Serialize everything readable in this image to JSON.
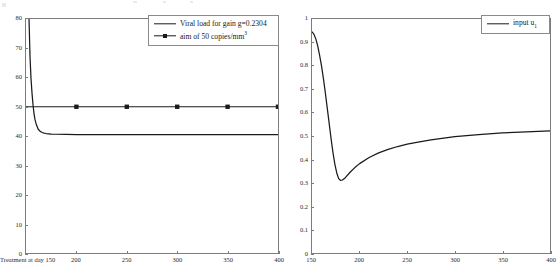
{
  "figure": {
    "background": "#ffffff",
    "line_color": "#1a1a1a",
    "axis_color": "#7c7c7c"
  },
  "chart_data": [
    {
      "type": "line",
      "panel": "left",
      "title": "",
      "xlabel": "",
      "ylabel": "",
      "xlim": [
        150,
        400
      ],
      "ylim": [
        0,
        80
      ],
      "grid": false,
      "legend_position": "top-right",
      "xticks": [
        150,
        200,
        250,
        300,
        350,
        400
      ],
      "xticklabels": [
        "Treatment at day 150",
        "200",
        "250",
        "300",
        "350",
        "400"
      ],
      "yticks": [
        0,
        10,
        20,
        30,
        40,
        50,
        60,
        70,
        80
      ],
      "yticklabels": [
        "0",
        "10",
        "20",
        "30",
        "40",
        "50",
        "60",
        "70",
        "80"
      ],
      "series": [
        {
          "name": "Viral load for gain g=0.2304",
          "marker": "none",
          "x": [
            150,
            151,
            152,
            153,
            154,
            155,
            156,
            157,
            158,
            159,
            160,
            162,
            164,
            166,
            168,
            170,
            175,
            180,
            190,
            200,
            220,
            250,
            300,
            350,
            400
          ],
          "y": [
            260,
            150,
            103,
            80,
            67,
            59.5,
            54.5,
            50.5,
            47.5,
            45.5,
            44.2,
            42.4,
            41.6,
            41.2,
            41.0,
            40.85,
            40.65,
            40.6,
            40.55,
            40.5,
            40.5,
            40.5,
            40.5,
            40.5,
            40.5
          ]
        },
        {
          "name": "aim of 50 copies/mm3",
          "marker": "filled-square",
          "x": [
            150,
            200,
            250,
            300,
            350,
            400
          ],
          "y": [
            50,
            50,
            50,
            50,
            50,
            50
          ],
          "marker_x": [
            200,
            250,
            300,
            350,
            400
          ]
        }
      ]
    },
    {
      "type": "line",
      "panel": "right",
      "title": "",
      "xlabel": "",
      "ylabel": "",
      "xlim": [
        150,
        400
      ],
      "ylim": [
        0,
        1
      ],
      "grid": false,
      "legend_position": "top-right",
      "xticks": [
        150,
        200,
        250,
        300,
        350,
        400
      ],
      "xticklabels": [
        "150",
        "200",
        "250",
        "300",
        "350",
        "400"
      ],
      "yticks": [
        0,
        0.1,
        0.2,
        0.3,
        0.4,
        0.5,
        0.6,
        0.7,
        0.8,
        0.9,
        1
      ],
      "yticklabels": [
        "0",
        "0.1",
        "0.2",
        "0.3",
        "0.4",
        "0.5",
        "0.6",
        "0.7",
        "0.8",
        "0.9",
        "1"
      ],
      "series": [
        {
          "name": "input u1",
          "marker": "none",
          "x": [
            150,
            152,
            154,
            156,
            158,
            160,
            162,
            164,
            166,
            168,
            170,
            172,
            174,
            176,
            178,
            180,
            182,
            185,
            190,
            195,
            200,
            210,
            220,
            230,
            240,
            250,
            260,
            275,
            300,
            325,
            350,
            375,
            400
          ],
          "y": [
            0.945,
            0.935,
            0.915,
            0.885,
            0.845,
            0.8,
            0.745,
            0.685,
            0.62,
            0.555,
            0.49,
            0.43,
            0.38,
            0.342,
            0.318,
            0.31,
            0.312,
            0.322,
            0.345,
            0.365,
            0.382,
            0.408,
            0.428,
            0.443,
            0.455,
            0.465,
            0.473,
            0.483,
            0.497,
            0.506,
            0.513,
            0.518,
            0.522
          ]
        }
      ]
    }
  ],
  "legend_left": {
    "entries": [
      {
        "label_before": "Viral load for gain g=0.2304",
        "sup": "",
        "label_after": "",
        "marker": "none"
      },
      {
        "label_before": "aim of 50 copies/mm",
        "sup": "3",
        "label_after": "",
        "marker": "filled-square"
      }
    ]
  },
  "legend_right": {
    "entries": [
      {
        "label_before": "input u",
        "sub": "1",
        "marker": "none"
      }
    ]
  },
  "axes_left": {
    "yticklabels": [
      "80",
      "70",
      "60",
      "50",
      "40",
      "30",
      "20",
      "10",
      "0"
    ],
    "xticklabels": [
      "Treatment at day 150",
      "200",
      "250",
      "300",
      "350",
      "400"
    ]
  },
  "axes_right": {
    "yticklabels": [
      "1",
      "0.9",
      "0.8",
      "0.7",
      "0.6",
      "0.5",
      "0.4",
      "0.3",
      "0.2",
      "0.1",
      "0"
    ],
    "xticklabels": [
      "150",
      "200",
      "250",
      "300",
      "350",
      "400"
    ]
  }
}
